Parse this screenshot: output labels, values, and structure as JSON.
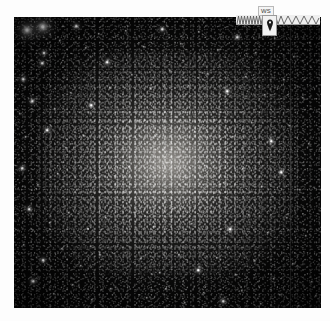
{
  "page": {
    "background_color": "#ffffff",
    "width": 330,
    "height": 321
  },
  "image_plate": {
    "name": "star-field-photograph",
    "description": "Dense globular star cluster on black sky",
    "background_color": "#050505",
    "glow_color": "#c4c0b9",
    "star_color": "#ffffff",
    "bounds": {
      "left": 14,
      "top": 17,
      "width": 307,
      "height": 291
    },
    "bright_stars": [
      {
        "x": 13,
        "y": 13,
        "size": 3.0,
        "class": "bright"
      },
      {
        "x": 29,
        "y": 10,
        "size": 3.4,
        "class": "bright"
      },
      {
        "x": 30,
        "y": 36,
        "size": 2.0,
        "class": "mid"
      },
      {
        "x": 28,
        "y": 46,
        "size": 1.6,
        "class": "mid"
      },
      {
        "x": 9,
        "y": 62,
        "size": 1.5,
        "class": "mid"
      },
      {
        "x": 46,
        "y": 24,
        "size": 1.4,
        "class": "faint"
      },
      {
        "x": 62,
        "y": 9,
        "size": 1.5,
        "class": "mid"
      },
      {
        "x": 72,
        "y": 31,
        "size": 1.3,
        "class": "faint"
      },
      {
        "x": 85,
        "y": 17,
        "size": 1.4,
        "class": "faint"
      },
      {
        "x": 93,
        "y": 45,
        "size": 1.6,
        "class": "mid"
      },
      {
        "x": 18,
        "y": 84,
        "size": 1.5,
        "class": "mid"
      },
      {
        "x": 6,
        "y": 97,
        "size": 1.3,
        "class": "faint"
      },
      {
        "x": 41,
        "y": 92,
        "size": 1.4,
        "class": "faint"
      },
      {
        "x": 57,
        "y": 76,
        "size": 1.3,
        "class": "faint"
      },
      {
        "x": 77,
        "y": 88,
        "size": 1.5,
        "class": "mid"
      },
      {
        "x": 96,
        "y": 71,
        "size": 1.3,
        "class": "faint"
      },
      {
        "x": 12,
        "y": 120,
        "size": 1.4,
        "class": "faint"
      },
      {
        "x": 33,
        "y": 113,
        "size": 1.6,
        "class": "mid"
      },
      {
        "x": 52,
        "y": 131,
        "size": 1.3,
        "class": "faint"
      },
      {
        "x": 70,
        "y": 119,
        "size": 1.4,
        "class": "faint"
      },
      {
        "x": 88,
        "y": 136,
        "size": 1.3,
        "class": "faint"
      },
      {
        "x": 8,
        "y": 151,
        "size": 1.5,
        "class": "mid"
      },
      {
        "x": 24,
        "y": 168,
        "size": 1.3,
        "class": "faint"
      },
      {
        "x": 44,
        "y": 157,
        "size": 1.4,
        "class": "faint"
      },
      {
        "x": 63,
        "y": 173,
        "size": 1.3,
        "class": "faint"
      },
      {
        "x": 82,
        "y": 161,
        "size": 1.4,
        "class": "faint"
      },
      {
        "x": 15,
        "y": 192,
        "size": 1.6,
        "class": "mid"
      },
      {
        "x": 36,
        "y": 206,
        "size": 1.3,
        "class": "faint"
      },
      {
        "x": 55,
        "y": 196,
        "size": 1.4,
        "class": "faint"
      },
      {
        "x": 74,
        "y": 212,
        "size": 1.3,
        "class": "faint"
      },
      {
        "x": 92,
        "y": 201,
        "size": 1.4,
        "class": "faint"
      },
      {
        "x": 10,
        "y": 228,
        "size": 1.4,
        "class": "faint"
      },
      {
        "x": 29,
        "y": 243,
        "size": 1.6,
        "class": "mid"
      },
      {
        "x": 48,
        "y": 232,
        "size": 1.3,
        "class": "faint"
      },
      {
        "x": 67,
        "y": 249,
        "size": 1.4,
        "class": "faint"
      },
      {
        "x": 86,
        "y": 238,
        "size": 1.3,
        "class": "faint"
      },
      {
        "x": 19,
        "y": 264,
        "size": 1.5,
        "class": "mid"
      },
      {
        "x": 40,
        "y": 277,
        "size": 1.3,
        "class": "faint"
      },
      {
        "x": 59,
        "y": 268,
        "size": 1.4,
        "class": "faint"
      },
      {
        "x": 78,
        "y": 283,
        "size": 1.3,
        "class": "faint"
      },
      {
        "x": 97,
        "y": 272,
        "size": 1.4,
        "class": "faint"
      },
      {
        "x": 112,
        "y": 14,
        "size": 1.4,
        "class": "faint"
      },
      {
        "x": 130,
        "y": 30,
        "size": 1.3,
        "class": "faint"
      },
      {
        "x": 148,
        "y": 12,
        "size": 1.5,
        "class": "mid"
      },
      {
        "x": 167,
        "y": 27,
        "size": 1.3,
        "class": "faint"
      },
      {
        "x": 185,
        "y": 15,
        "size": 1.4,
        "class": "faint"
      },
      {
        "x": 204,
        "y": 33,
        "size": 1.3,
        "class": "faint"
      },
      {
        "x": 223,
        "y": 20,
        "size": 1.5,
        "class": "mid"
      },
      {
        "x": 242,
        "y": 36,
        "size": 1.3,
        "class": "faint"
      },
      {
        "x": 261,
        "y": 22,
        "size": 1.4,
        "class": "faint"
      },
      {
        "x": 280,
        "y": 40,
        "size": 1.3,
        "class": "faint"
      },
      {
        "x": 296,
        "y": 26,
        "size": 1.4,
        "class": "faint"
      },
      {
        "x": 118,
        "y": 58,
        "size": 1.3,
        "class": "faint"
      },
      {
        "x": 137,
        "y": 72,
        "size": 1.4,
        "class": "faint"
      },
      {
        "x": 156,
        "y": 54,
        "size": 1.3,
        "class": "faint"
      },
      {
        "x": 175,
        "y": 69,
        "size": 1.4,
        "class": "faint"
      },
      {
        "x": 194,
        "y": 57,
        "size": 1.3,
        "class": "faint"
      },
      {
        "x": 213,
        "y": 74,
        "size": 1.5,
        "class": "mid"
      },
      {
        "x": 232,
        "y": 60,
        "size": 1.3,
        "class": "faint"
      },
      {
        "x": 251,
        "y": 78,
        "size": 1.4,
        "class": "faint"
      },
      {
        "x": 270,
        "y": 63,
        "size": 1.3,
        "class": "faint"
      },
      {
        "x": 289,
        "y": 81,
        "size": 1.4,
        "class": "faint"
      },
      {
        "x": 124,
        "y": 104,
        "size": 1.3,
        "class": "faint"
      },
      {
        "x": 143,
        "y": 118,
        "size": 1.4,
        "class": "faint"
      },
      {
        "x": 162,
        "y": 100,
        "size": 1.3,
        "class": "faint"
      },
      {
        "x": 181,
        "y": 115,
        "size": 1.4,
        "class": "faint"
      },
      {
        "x": 200,
        "y": 103,
        "size": 1.3,
        "class": "faint"
      },
      {
        "x": 219,
        "y": 120,
        "size": 1.4,
        "class": "faint"
      },
      {
        "x": 238,
        "y": 106,
        "size": 1.3,
        "class": "faint"
      },
      {
        "x": 257,
        "y": 124,
        "size": 1.5,
        "class": "mid"
      },
      {
        "x": 276,
        "y": 109,
        "size": 1.3,
        "class": "faint"
      },
      {
        "x": 295,
        "y": 127,
        "size": 1.4,
        "class": "faint"
      },
      {
        "x": 115,
        "y": 150,
        "size": 1.3,
        "class": "faint"
      },
      {
        "x": 134,
        "y": 164,
        "size": 1.4,
        "class": "faint"
      },
      {
        "x": 153,
        "y": 146,
        "size": 1.3,
        "class": "faint"
      },
      {
        "x": 172,
        "y": 161,
        "size": 1.4,
        "class": "faint"
      },
      {
        "x": 191,
        "y": 149,
        "size": 1.3,
        "class": "faint"
      },
      {
        "x": 210,
        "y": 166,
        "size": 1.4,
        "class": "faint"
      },
      {
        "x": 229,
        "y": 152,
        "size": 1.3,
        "class": "faint"
      },
      {
        "x": 248,
        "y": 170,
        "size": 1.4,
        "class": "faint"
      },
      {
        "x": 267,
        "y": 155,
        "size": 1.5,
        "class": "mid"
      },
      {
        "x": 286,
        "y": 173,
        "size": 1.3,
        "class": "faint"
      },
      {
        "x": 121,
        "y": 196,
        "size": 1.3,
        "class": "faint"
      },
      {
        "x": 140,
        "y": 210,
        "size": 1.4,
        "class": "faint"
      },
      {
        "x": 159,
        "y": 192,
        "size": 1.3,
        "class": "faint"
      },
      {
        "x": 178,
        "y": 207,
        "size": 1.4,
        "class": "faint"
      },
      {
        "x": 197,
        "y": 195,
        "size": 1.3,
        "class": "faint"
      },
      {
        "x": 216,
        "y": 212,
        "size": 1.5,
        "class": "mid"
      },
      {
        "x": 235,
        "y": 198,
        "size": 1.3,
        "class": "faint"
      },
      {
        "x": 254,
        "y": 216,
        "size": 1.4,
        "class": "faint"
      },
      {
        "x": 273,
        "y": 201,
        "size": 1.3,
        "class": "faint"
      },
      {
        "x": 292,
        "y": 219,
        "size": 1.4,
        "class": "faint"
      },
      {
        "x": 127,
        "y": 242,
        "size": 1.3,
        "class": "faint"
      },
      {
        "x": 146,
        "y": 256,
        "size": 1.4,
        "class": "faint"
      },
      {
        "x": 165,
        "y": 238,
        "size": 1.3,
        "class": "faint"
      },
      {
        "x": 184,
        "y": 253,
        "size": 1.5,
        "class": "mid"
      },
      {
        "x": 203,
        "y": 241,
        "size": 1.3,
        "class": "faint"
      },
      {
        "x": 222,
        "y": 258,
        "size": 1.4,
        "class": "faint"
      },
      {
        "x": 241,
        "y": 244,
        "size": 1.3,
        "class": "faint"
      },
      {
        "x": 260,
        "y": 262,
        "size": 1.4,
        "class": "faint"
      },
      {
        "x": 279,
        "y": 247,
        "size": 1.3,
        "class": "faint"
      },
      {
        "x": 298,
        "y": 265,
        "size": 1.4,
        "class": "faint"
      },
      {
        "x": 133,
        "y": 281,
        "size": 1.4,
        "class": "faint"
      },
      {
        "x": 152,
        "y": 272,
        "size": 1.3,
        "class": "faint"
      },
      {
        "x": 171,
        "y": 286,
        "size": 1.4,
        "class": "faint"
      },
      {
        "x": 190,
        "y": 276,
        "size": 1.3,
        "class": "faint"
      },
      {
        "x": 209,
        "y": 284,
        "size": 1.5,
        "class": "mid"
      },
      {
        "x": 228,
        "y": 274,
        "size": 1.3,
        "class": "faint"
      },
      {
        "x": 247,
        "y": 287,
        "size": 1.4,
        "class": "faint"
      },
      {
        "x": 266,
        "y": 278,
        "size": 1.3,
        "class": "faint"
      },
      {
        "x": 285,
        "y": 289,
        "size": 1.4,
        "class": "faint"
      },
      {
        "x": 302,
        "y": 279,
        "size": 1.3,
        "class": "faint"
      }
    ],
    "seam": {
      "x": 276,
      "color": "#8c8c8c"
    }
  },
  "overlay": {
    "name": "measurement-widget",
    "tick_label": "WS",
    "tick_label_background": "#f4f4f4",
    "tick_label_border": "#b9b9b9",
    "marker_box_background": "#f2f2f2",
    "marker_box_border": "#9a9a9a",
    "marker_icon": "map-pin-icon",
    "marker_color": "#1a1a1a",
    "zigzag_color": "#5a5a5a",
    "zigzag_strip_background": "#efefef"
  }
}
